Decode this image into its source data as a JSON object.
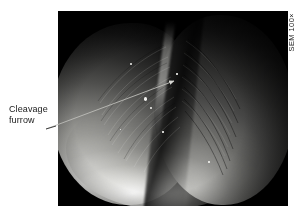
{
  "figure": {
    "background_color": "#ffffff"
  },
  "micrograph": {
    "panel_background": "#000000",
    "technique": "scanning electron micrograph",
    "specimen_description": "two rounded daughter lobes pinched apart by a deep cleavage furrow"
  },
  "magnification": {
    "caption": "SEM 100×"
  },
  "callout": {
    "name": "cleavage-furrow",
    "line1": "Cleavage",
    "line2": "furrow",
    "leader": {
      "color": "#3c3c3c",
      "start_x": 46,
      "start_y": 129,
      "end_x": 174,
      "end_y": 81
    }
  },
  "colors": {
    "panel": "#000000",
    "text": "#1a1a1a",
    "leader": "#3c3c3c",
    "highlight": "#f2f2ef"
  }
}
